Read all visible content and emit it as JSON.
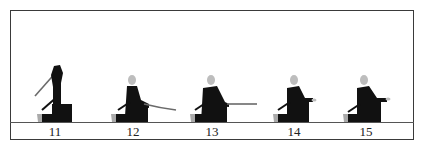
{
  "diagram": {
    "frames": [
      {
        "number": "11",
        "pose": "sword raised overhead"
      },
      {
        "number": "12",
        "pose": "sword lowered, blade angled down forward"
      },
      {
        "number": "13",
        "pose": "sword extended horizontally forward"
      },
      {
        "number": "14",
        "pose": "hands forward, sword sheathing"
      },
      {
        "number": "15",
        "pose": "hands forward, sword sheathed"
      }
    ]
  },
  "colors": {
    "figure": "#111111",
    "head": "#bdbdbd",
    "blade": "#6a6a6a",
    "frame": "#3a3a3a"
  }
}
